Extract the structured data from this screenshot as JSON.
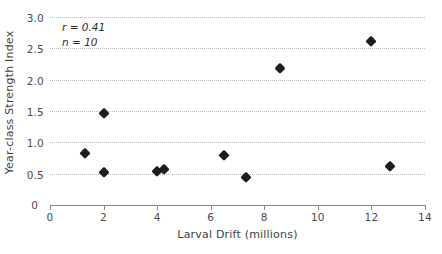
{
  "chart_data": {
    "type": "scatter",
    "title": "",
    "xlabel": "Larval Drift (millions)",
    "ylabel": "Year-class Strength Index",
    "xlim": [
      0,
      14
    ],
    "ylim": [
      0,
      3.0
    ],
    "xticks": [
      0,
      2,
      4,
      6,
      8,
      10,
      12,
      14
    ],
    "xtick_labels": [
      "0",
      "2",
      "4",
      "6",
      "8",
      "10",
      "12",
      "14"
    ],
    "yticks": [
      0,
      0.5,
      1.0,
      1.5,
      2.0,
      2.5,
      3.0
    ],
    "ytick_labels": [
      "0",
      "0.5",
      "1.0",
      "1.5",
      "2.0",
      "2.5",
      "3.0"
    ],
    "grid": "horizontal-dotted",
    "legend": "none",
    "marker": "diamond",
    "marker_color": "#1d1d1d",
    "annotations": [
      {
        "text": "r = 0.41",
        "style": "italic"
      },
      {
        "text": "n = 10",
        "style": "italic"
      }
    ],
    "correlation_r": 0.41,
    "sample_size": 10,
    "x": [
      1.3,
      2.0,
      2.0,
      4.0,
      4.25,
      6.5,
      7.3,
      8.6,
      12.0,
      12.7
    ],
    "y": [
      0.83,
      1.47,
      0.52,
      0.55,
      0.58,
      0.8,
      0.45,
      2.18,
      2.62,
      0.62
    ],
    "points": [
      {
        "x": 1.3,
        "y": 0.83
      },
      {
        "x": 2.0,
        "y": 1.47
      },
      {
        "x": 2.0,
        "y": 0.52
      },
      {
        "x": 4.0,
        "y": 0.55
      },
      {
        "x": 4.25,
        "y": 0.58
      },
      {
        "x": 6.5,
        "y": 0.8
      },
      {
        "x": 7.3,
        "y": 0.45
      },
      {
        "x": 8.6,
        "y": 2.18
      },
      {
        "x": 12.0,
        "y": 2.62
      },
      {
        "x": 12.7,
        "y": 0.62
      }
    ]
  }
}
